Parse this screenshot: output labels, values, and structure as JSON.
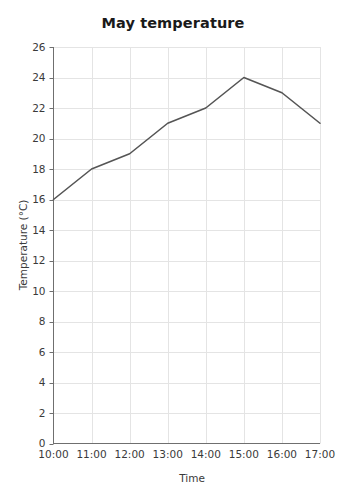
{
  "chart_data": {
    "type": "line",
    "title": "May temperature",
    "xlabel": "Time",
    "ylabel": "Temperature (°C)",
    "categories": [
      "10:00",
      "11:00",
      "12:00",
      "13:00",
      "14:00",
      "15:00",
      "16:00",
      "17:00"
    ],
    "values": [
      16,
      18,
      19,
      21,
      22,
      24,
      23,
      21
    ],
    "series": [
      {
        "name": "Temperature",
        "values": [
          16,
          18,
          19,
          21,
          22,
          24,
          23,
          21
        ]
      }
    ],
    "ylim": [
      0,
      26
    ],
    "ytick_labels": [
      "0",
      "2",
      "4",
      "6",
      "8",
      "10",
      "12",
      "14",
      "16",
      "18",
      "20",
      "22",
      "24",
      "26"
    ],
    "ytick_values": [
      0,
      2,
      4,
      6,
      8,
      10,
      12,
      14,
      16,
      18,
      20,
      22,
      24,
      26
    ],
    "xtick_labels": [
      "10:00",
      "11:00",
      "12:00",
      "13:00",
      "14:00",
      "15:00",
      "16:00",
      "17:00"
    ],
    "grid": true,
    "legend": false,
    "legend_position": "none",
    "line_color": "#555555",
    "grid_color": "#e4e4e4",
    "axis_color": "#6f6f6f",
    "background_color": "#ffffff"
  }
}
